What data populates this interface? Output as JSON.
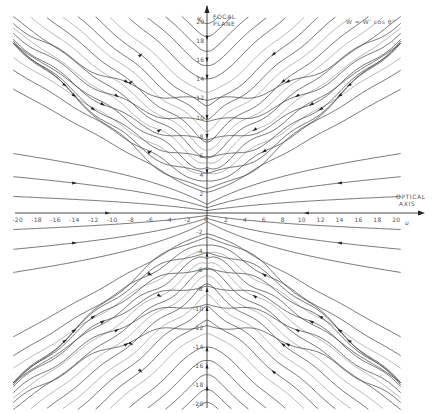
{
  "figure": {
    "type": "streamline diagram",
    "formula": "W = W' cos θ°",
    "vertical_axis": {
      "symbol": "v",
      "title_line1": "FOCAL",
      "title_line2": "PLANE"
    },
    "horizontal_axis": {
      "symbol": "u",
      "title_line1": "OPTICAL",
      "title_line2": "AXIS"
    },
    "x_ticks": [
      "-20",
      "-18",
      "-16",
      "-14",
      "-12",
      "-10",
      "-8",
      "-6",
      "-4",
      "-2",
      "2",
      "4",
      "6",
      "8",
      "10",
      "12",
      "14",
      "16",
      "18",
      "20"
    ],
    "y_ticks_upper": [
      "20",
      "18",
      "16",
      "14",
      "12",
      "10",
      "8",
      "6",
      "4",
      "2"
    ],
    "y_ticks_lower": [
      "-2",
      "-4",
      "-6",
      "-8",
      "-10",
      "-12",
      "-14",
      "-16",
      "-18",
      "-20"
    ],
    "origin_label": "0"
  },
  "chart_data": {
    "type": "streamline",
    "title": "",
    "annotation": "W = W' cos θ°",
    "xlabel": "u (OPTICAL AXIS)",
    "ylabel": "v (FOCAL PLANE)",
    "xlim": [
      -20,
      20
    ],
    "ylim": [
      -20,
      20
    ],
    "x_ticks": [
      -20,
      -18,
      -16,
      -14,
      -12,
      -10,
      -8,
      -6,
      -4,
      -2,
      0,
      2,
      4,
      6,
      8,
      10,
      12,
      14,
      16,
      18,
      20
    ],
    "y_ticks": [
      -20,
      -18,
      -16,
      -14,
      -12,
      -10,
      -8,
      -6,
      -4,
      -2,
      0,
      2,
      4,
      6,
      8,
      10,
      12,
      14,
      16,
      18,
      20
    ],
    "grid": false,
    "symmetry": "mirror-symmetric about u=0 and v=0"
  }
}
